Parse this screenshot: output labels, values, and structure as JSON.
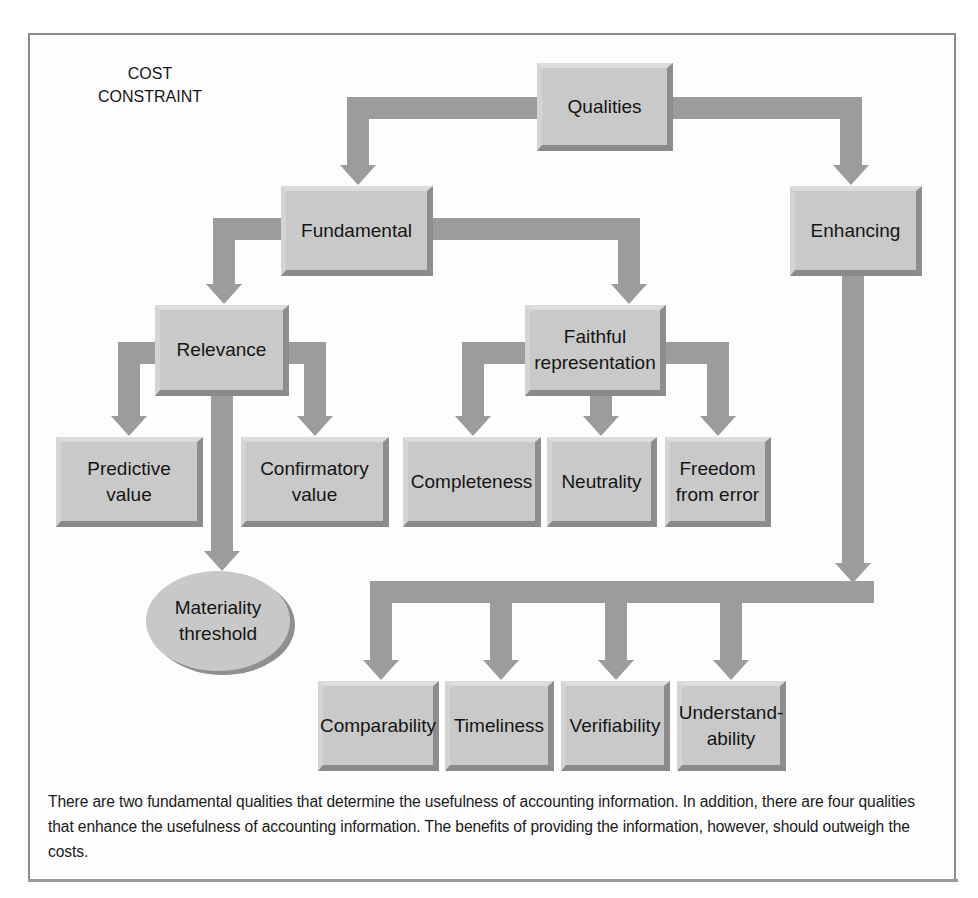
{
  "diagram": {
    "corner_label": "COST\nCONSTRAINT",
    "corner_label_lines": [
      "COST",
      "CONSTRAINT"
    ],
    "nodes": {
      "qualities": {
        "label": "Qualities"
      },
      "fundamental": {
        "label": "Fundamental"
      },
      "enhancing": {
        "label": "Enhancing"
      },
      "relevance": {
        "label": "Relevance"
      },
      "faithful_representation": {
        "label_lines": [
          "Faithful",
          "representation"
        ]
      },
      "predictive_value": {
        "label_lines": [
          "Predictive",
          "value"
        ]
      },
      "confirmatory_value": {
        "label_lines": [
          "Confirmatory",
          "value"
        ]
      },
      "materiality_threshold": {
        "label_lines": [
          "Materiality",
          "threshold"
        ]
      },
      "completeness": {
        "label": "Completeness"
      },
      "neutrality": {
        "label": "Neutrality"
      },
      "freedom_from_error": {
        "label_lines": [
          "Freedom",
          "from error"
        ]
      },
      "comparability": {
        "label": "Comparability"
      },
      "timeliness": {
        "label": "Timeliness"
      },
      "verifiability": {
        "label": "Verifiability"
      },
      "understandability": {
        "label_lines": [
          "Understand-",
          "ability"
        ]
      }
    },
    "edges": [
      [
        "Qualities",
        "Fundamental"
      ],
      [
        "Qualities",
        "Enhancing"
      ],
      [
        "Fundamental",
        "Relevance"
      ],
      [
        "Fundamental",
        "Faithful representation"
      ],
      [
        "Relevance",
        "Predictive value"
      ],
      [
        "Relevance",
        "Confirmatory value"
      ],
      [
        "Relevance",
        "Materiality threshold"
      ],
      [
        "Faithful representation",
        "Completeness"
      ],
      [
        "Faithful representation",
        "Neutrality"
      ],
      [
        "Faithful representation",
        "Freedom from error"
      ],
      [
        "Enhancing",
        "Comparability"
      ],
      [
        "Enhancing",
        "Timeliness"
      ],
      [
        "Enhancing",
        "Verifiability"
      ],
      [
        "Enhancing",
        "Understandability"
      ]
    ],
    "colors": {
      "box_fill": "#c9c9c9",
      "arrow_fill": "#9c9c9c",
      "frame_border": "#8a8a8a",
      "text": "#151515"
    }
  },
  "caption": "There are two fundamental qualities that determine the usefulness of accounting information. In addition, there are four qualities that enhance the usefulness of accounting information. The benefits of providing the information, however, should outweigh the costs."
}
